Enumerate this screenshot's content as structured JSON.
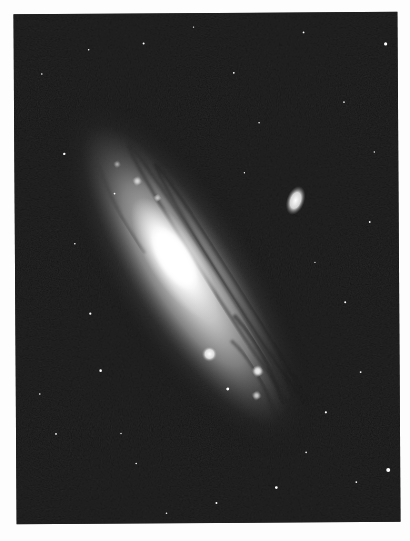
{
  "image": {
    "subject": "Andromeda Galaxy (spiral galaxy) with two satellite galaxies",
    "style": "black-and-white astronomical photograph",
    "background_color": "#fdfdfd",
    "sky_color": "#141414",
    "galaxy": {
      "center": [
        185,
        260
      ],
      "angle_deg": 50,
      "core_color": "#ffffff",
      "halo_color": "#bdbdbd"
    },
    "satellites": [
      {
        "name": "upper-right-satellite",
        "center": [
          281,
          188
        ],
        "rx": 6,
        "ry": 11,
        "angle_deg": 20
      },
      {
        "name": "lower-left-satellite",
        "center": [
          194,
          341
        ],
        "rx": 5,
        "ry": 5,
        "angle_deg": 0
      }
    ]
  }
}
